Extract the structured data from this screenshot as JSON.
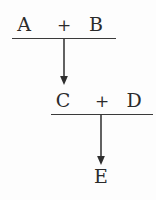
{
  "diagram": {
    "type": "reaction-sequence",
    "ink_color": "#2b2b2b",
    "rule_color": "#3a3a3a",
    "background_color": "#fdfdfd",
    "steps": [
      {
        "id": "step-1",
        "reactants": [
          "A",
          "B"
        ],
        "operator": "+",
        "expression": "A + B",
        "has_rule": true,
        "arrow": "down"
      },
      {
        "id": "step-2",
        "reactants": [
          "C",
          "D"
        ],
        "operator": "+",
        "expression": "C + D",
        "has_rule": true,
        "arrow": "down"
      }
    ],
    "product": {
      "id": "product",
      "label": "E"
    },
    "terms": {
      "a": "A",
      "b": "B",
      "c": "C",
      "d": "D",
      "e": "E",
      "plus_1": "+",
      "plus_2": "+"
    },
    "arrows": [
      {
        "name": "arrow-step-1-to-step-2",
        "direction": "down",
        "length": 46
      },
      {
        "name": "arrow-step-2-to-product",
        "direction": "down",
        "length": 50
      }
    ]
  }
}
